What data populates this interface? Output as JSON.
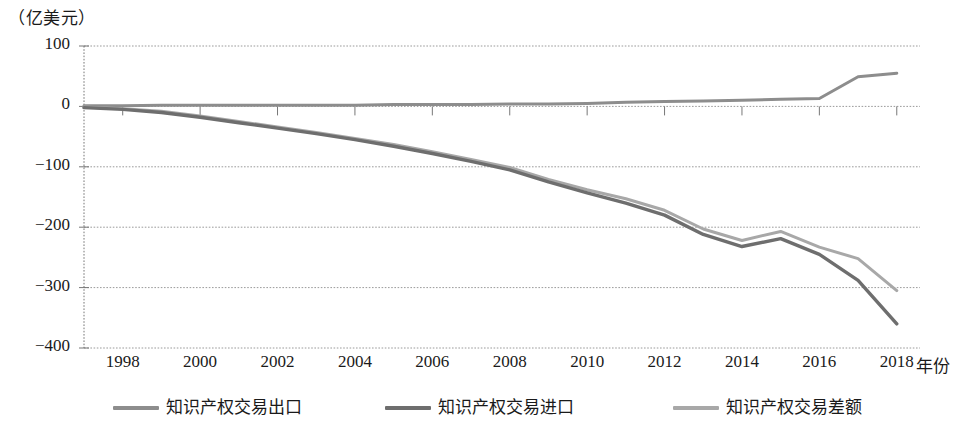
{
  "chart_data": {
    "type": "line",
    "title": "",
    "subtitle": "",
    "unit_label": "（亿美元）",
    "xlabel": "年份",
    "ylabel": "",
    "grid": true,
    "legend_position": "bottom",
    "xlim": [
      1997,
      2018.6
    ],
    "ylim": [
      -400,
      100
    ],
    "y_ticks": [
      100,
      0,
      -100,
      -200,
      -300,
      -400
    ],
    "y_tick_labels": [
      "100",
      "0",
      "-100",
      "-200",
      "-300",
      "-400"
    ],
    "x_ticks": [
      1998,
      2000,
      2002,
      2004,
      2006,
      2008,
      2010,
      2012,
      2014,
      2016,
      2018
    ],
    "x_tick_labels": [
      "1998",
      "2000",
      "2002",
      "2004",
      "2006",
      "2008",
      "2010",
      "2012",
      "2014",
      "2016",
      "2018"
    ],
    "x": [
      1997,
      1998,
      1999,
      2000,
      2001,
      2002,
      2003,
      2004,
      2005,
      2006,
      2007,
      2008,
      2009,
      2010,
      2011,
      2012,
      2013,
      2014,
      2015,
      2016,
      2017,
      2018
    ],
    "series": [
      {
        "name": "知识产权交易出口",
        "color": "#8d8d8d",
        "values": [
          1,
          1,
          2,
          2,
          2,
          2,
          2,
          2,
          3,
          3,
          3,
          4,
          4,
          5,
          7,
          8,
          9,
          10,
          12,
          13,
          49,
          55
        ]
      },
      {
        "name": "知识产权交易进口",
        "color": "#6e6e6e",
        "values": [
          -2,
          -5,
          -10,
          -18,
          -27,
          -36,
          -45,
          -55,
          -66,
          -78,
          -91,
          -105,
          -125,
          -143,
          -160,
          -180,
          -212,
          -232,
          -219,
          -245,
          -288,
          -360
        ]
      },
      {
        "name": "知识产权交易差额",
        "color": "#a8a8a8",
        "values": [
          -1,
          -4,
          -8,
          -16,
          -25,
          -34,
          -43,
          -53,
          -63,
          -75,
          -88,
          -101,
          -121,
          -138,
          -153,
          -172,
          -203,
          -222,
          -207,
          -233,
          -252,
          -305
        ]
      }
    ]
  },
  "axis": {
    "unit_label": "（亿美元）",
    "x_title": "年份"
  },
  "legend": {
    "items": [
      {
        "label": "知识产权交易出口"
      },
      {
        "label": "知识产权交易进口"
      },
      {
        "label": "知识产权交易差额"
      }
    ]
  }
}
